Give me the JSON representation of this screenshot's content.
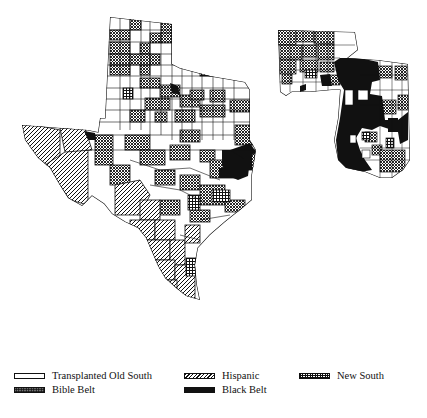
{
  "map": {
    "subject": "Texas, Arkansas and Louisiana counties/parishes by cultural region",
    "regions": {
      "transplanted_old_south": {
        "label": "Transplanted Old South",
        "fill": "#ffffff",
        "pattern": "plain-white"
      },
      "bible_belt": {
        "label": "Bible Belt",
        "fill": "#777777",
        "pattern": "dense-crosshatch"
      },
      "hispanic": {
        "label": "Hispanic",
        "fill": "#d0d0d0",
        "pattern": "diagonal-hatch"
      },
      "black_belt": {
        "label": "Black Belt",
        "fill": "#111111",
        "pattern": "solid-black"
      },
      "new_south": {
        "label": "New South",
        "fill": "#555555",
        "pattern": "grid-hatch"
      }
    }
  },
  "legend": {
    "items": [
      {
        "key": "transplanted_old_south",
        "label": "Transplanted Old South"
      },
      {
        "key": "hispanic",
        "label": "Hispanic"
      },
      {
        "key": "new_south",
        "label": "New South"
      },
      {
        "key": "bible_belt",
        "label": "Bible Belt"
      },
      {
        "key": "black_belt",
        "label": "Black Belt"
      }
    ]
  }
}
